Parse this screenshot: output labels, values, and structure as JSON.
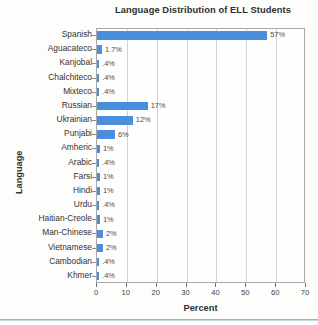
{
  "chart_data": {
    "type": "bar",
    "orientation": "horizontal",
    "title": "Language Distribution of ELL Students",
    "xlabel": "Percent",
    "ylabel": "Language",
    "xlim": [
      0,
      70
    ],
    "xticks": [
      0,
      10,
      20,
      30,
      40,
      50,
      60,
      70
    ],
    "xtick_labels": [
      "0",
      "10",
      "20",
      "30",
      "40",
      "50",
      "60",
      "70"
    ],
    "grid": true,
    "legend": null,
    "bar_color": "#4a8fdb",
    "categories": [
      "Spanish",
      "Aguacateco",
      "Kanjobal",
      "Chalchiteco",
      "Mixteco",
      "Russian",
      "Ukrainian",
      "Punjabi",
      "Amheric",
      "Arabic",
      "Farsi",
      "Hindi",
      "Urdu",
      "Haitian-Creole",
      "Man-Chinese",
      "Vietnamese",
      "Cambodian",
      "Khmer"
    ],
    "values": [
      57,
      1.7,
      0.4,
      0.4,
      0.4,
      17,
      12,
      6,
      1,
      0.4,
      1,
      1,
      0.4,
      1,
      2,
      2,
      0.4,
      0.4
    ],
    "data_labels": [
      "57%",
      "1.7%",
      ".4%",
      ".4%",
      ".4%",
      "17%",
      "12%",
      "6%",
      "1%",
      ".4%",
      "1%",
      "1%",
      ".4%",
      "1%",
      "2%",
      "2%",
      ".4%",
      ".4%"
    ]
  }
}
